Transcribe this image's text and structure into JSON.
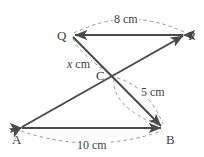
{
  "figure": {
    "stroke_color": "#4a4a4a",
    "dash_color": "#8d8d8d",
    "text_color": "#3f3f3f",
    "background": "#ffffff",
    "width": 204,
    "height": 157
  },
  "vertices": [
    {
      "name": "Q",
      "label": "Q",
      "x": 72,
      "y": 35,
      "label_x": 57,
      "label_y": 29
    },
    {
      "name": "P",
      "label": "P",
      "x": 185,
      "y": 35,
      "label_x": 188,
      "label_y": 29
    },
    {
      "name": "C",
      "label": "C",
      "x": 113,
      "y": 76,
      "label_x": 96,
      "label_y": 69
    },
    {
      "name": "A",
      "label": "A",
      "x": 20,
      "y": 128,
      "label_x": 12,
      "label_y": 133
    },
    {
      "name": "B",
      "label": "B",
      "x": 163,
      "y": 128,
      "label_x": 166,
      "label_y": 133
    }
  ],
  "segments": [
    {
      "name": "segment-PQ",
      "from": "P",
      "to": "Q",
      "arrow": "both"
    },
    {
      "name": "segment-QB",
      "from": "Q",
      "to": "B",
      "arrow": "end"
    },
    {
      "name": "segment-AP",
      "from": "A",
      "to": "P",
      "arrow": "both"
    },
    {
      "name": "segment-AB",
      "from": "A",
      "to": "B",
      "arrow": "both"
    }
  ],
  "measurements": [
    {
      "name": "measure-QP",
      "text": "8 cm",
      "value": 8,
      "unit": "cm",
      "between": [
        "Q",
        "P"
      ],
      "label_x": 113,
      "label_y": 13
    },
    {
      "name": "measure-QC",
      "text": "x cm",
      "value": "x",
      "unit": "cm",
      "between": [
        "Q",
        "C"
      ],
      "italic_prefix": "x",
      "suffix": " cm",
      "label_x": 66,
      "label_y": 58
    },
    {
      "name": "measure-CB",
      "text": "5 cm",
      "value": 5,
      "unit": "cm",
      "between": [
        "C",
        "B"
      ],
      "label_x": 140,
      "label_y": 86
    },
    {
      "name": "measure-AB",
      "text": "10 cm",
      "value": 10,
      "unit": "cm",
      "between": [
        "A",
        "B"
      ],
      "label_x": 76,
      "label_y": 139
    }
  ]
}
